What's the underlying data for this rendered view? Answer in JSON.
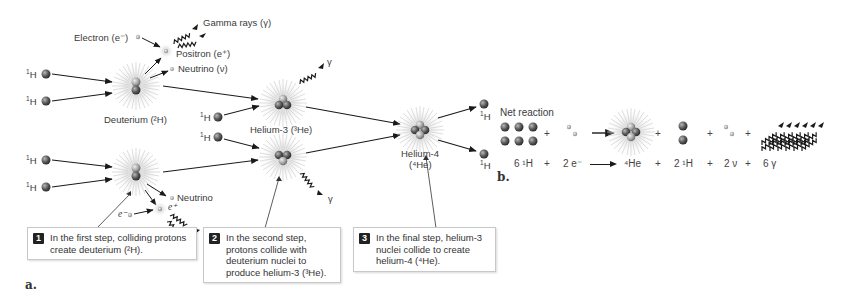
{
  "panel_a": {
    "label": "a.",
    "particles": {
      "h1": "H",
      "h1_sup": "1",
      "electron": "Electron (e⁻)",
      "gamma_rays": "Gamma rays (γ)",
      "positron": "Positron (e⁺)",
      "neutrino_nu": "Neutrino (ν)",
      "deuterium": "Deuterium (²H)",
      "helium3": "Helium-3 (³He)",
      "helium4_line1": "Helium-4",
      "helium4_line2": "(⁴He)",
      "neutrino": "Neutrino",
      "e_minus": "e⁻",
      "e_plus": "e⁺",
      "gamma": "γ"
    },
    "callouts": [
      {
        "num": "1",
        "text": "In the first step, colliding protons create deuterium (²H)."
      },
      {
        "num": "2",
        "text": "In the second step, protons collide with deuterium nuclei to produce helium-3 (³He)."
      },
      {
        "num": "3",
        "text": "In the final step, helium-3 nuclei collide to create helium-4 (⁴He)."
      }
    ]
  },
  "panel_b": {
    "label": "b.",
    "title": "Net reaction",
    "equation": {
      "t1": "6 ¹H",
      "plus1": "+",
      "t2": "2 e⁻",
      "t3": "⁴He",
      "plus2": "+",
      "t4": "2 ¹H",
      "plus3": "+",
      "t5": "2 ν",
      "plus4": "+",
      "t6": "6 γ"
    }
  },
  "colors": {
    "proton_dark": "#555555",
    "proton_light": "#9a9a9a",
    "neutron": "#b5b5b5",
    "glow": "#cfcfcf",
    "arrow": "#1a1a1a",
    "text": "#3a3a3a"
  }
}
